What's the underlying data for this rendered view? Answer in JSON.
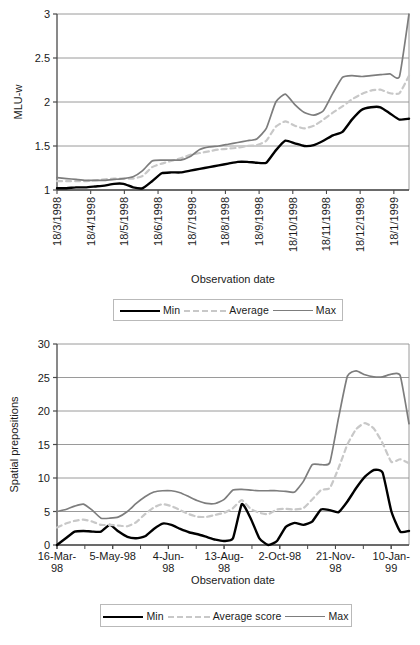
{
  "chart_data": [
    {
      "id": "mlu-chart",
      "type": "line",
      "title": "",
      "xlabel": "Observation date",
      "ylabel": "MLU-w",
      "ylim": [
        1,
        3
      ],
      "yticks": [
        1,
        1.5,
        2,
        2.5,
        3
      ],
      "ytick_labels": [
        "1",
        "1.5",
        "2",
        "2.5",
        "3"
      ],
      "grid": true,
      "legend_position": "below",
      "categories": [
        "18/3/1998",
        "18/4/1998",
        "18/5/1998",
        "18/6/1998",
        "18/7/1998",
        "18/8/1998",
        "18/9/1998",
        "18/10/1998",
        "18/11/1998",
        "18/12/1998",
        "18/1/1999"
      ],
      "x_index": [
        0,
        1,
        2,
        3,
        4,
        5,
        6,
        7,
        8,
        9,
        10,
        11,
        12,
        13,
        14,
        15,
        16,
        17,
        18,
        19,
        20,
        21,
        22,
        23,
        24,
        25,
        26,
        27,
        28,
        29,
        30,
        31,
        32,
        33,
        34,
        35,
        36,
        37
      ],
      "series": [
        {
          "name": "Min",
          "color": "#000000",
          "style": "solid",
          "values": [
            1.02,
            1.02,
            1.03,
            1.03,
            1.04,
            1.05,
            1.07,
            1.07,
            1.03,
            1.02,
            1.1,
            1.19,
            1.2,
            1.2,
            1.22,
            1.24,
            1.26,
            1.28,
            1.3,
            1.32,
            1.32,
            1.31,
            1.31,
            1.45,
            1.56,
            1.53,
            1.5,
            1.51,
            1.56,
            1.62,
            1.66,
            1.8,
            1.91,
            1.94,
            1.94,
            1.87,
            1.8,
            1.81
          ]
        },
        {
          "name": "Average",
          "color": "#c8c8c8",
          "style": "dashed",
          "values": [
            1.1,
            1.1,
            1.1,
            1.1,
            1.11,
            1.12,
            1.13,
            1.13,
            1.13,
            1.16,
            1.26,
            1.3,
            1.33,
            1.36,
            1.4,
            1.42,
            1.44,
            1.46,
            1.47,
            1.48,
            1.5,
            1.51,
            1.56,
            1.72,
            1.78,
            1.73,
            1.7,
            1.73,
            1.8,
            1.88,
            1.95,
            2.03,
            2.09,
            2.13,
            2.14,
            2.1,
            2.1,
            2.3
          ]
        },
        {
          "name": "Max",
          "color": "#7d7d7d",
          "style": "solid",
          "values": [
            1.14,
            1.13,
            1.12,
            1.11,
            1.11,
            1.11,
            1.12,
            1.13,
            1.15,
            1.22,
            1.33,
            1.34,
            1.34,
            1.34,
            1.38,
            1.46,
            1.49,
            1.5,
            1.52,
            1.54,
            1.56,
            1.58,
            1.7,
            2.0,
            2.09,
            1.97,
            1.88,
            1.85,
            1.9,
            2.1,
            2.28,
            2.3,
            2.29,
            2.3,
            2.31,
            2.32,
            2.29,
            3.0
          ]
        }
      ],
      "legend": [
        "Min",
        "Average",
        "Max"
      ]
    },
    {
      "id": "prepositions-chart",
      "type": "line",
      "title": "",
      "xlabel": "Observation date",
      "ylabel": "Spatial prepositions",
      "ylim": [
        0,
        30
      ],
      "yticks": [
        0,
        5,
        10,
        15,
        20,
        25,
        30
      ],
      "ytick_labels": [
        "0",
        "5",
        "10",
        "15",
        "20",
        "25",
        "30"
      ],
      "grid": true,
      "legend_position": "below",
      "categories": [
        "16-Mar-98",
        "5-May-98",
        "4-Jun-98",
        "13-Aug-98",
        "2-Oct-98",
        "21-Nov-98",
        "10-Jan-99"
      ],
      "x_index": [
        0,
        1,
        2,
        3,
        4,
        5,
        6,
        7,
        8,
        9,
        10,
        11,
        12,
        13,
        14,
        15,
        16,
        17,
        18,
        19,
        20,
        21,
        22,
        23,
        24,
        25,
        26,
        27,
        28,
        29,
        30,
        31,
        32,
        33,
        34,
        35,
        36,
        37,
        38,
        39,
        40
      ],
      "series": [
        {
          "name": "Min",
          "color": "#000000",
          "style": "solid",
          "values": [
            0.0,
            1.0,
            2.0,
            2.1,
            2.0,
            2.0,
            3.0,
            2.0,
            1.2,
            1.0,
            1.3,
            2.4,
            3.2,
            3.0,
            2.4,
            1.9,
            1.6,
            1.2,
            0.8,
            0.6,
            1.0,
            6.1,
            4.0,
            1.0,
            0.0,
            0.6,
            2.7,
            3.3,
            3.0,
            3.5,
            5.3,
            5.2,
            4.9,
            6.5,
            8.5,
            10.2,
            11.2,
            10.8,
            5.0,
            2.0,
            2.1
          ]
        },
        {
          "name": "Average score",
          "color": "#c8c8c8",
          "style": "dashed",
          "values": [
            2.6,
            3.2,
            3.6,
            3.8,
            3.5,
            3.0,
            3.0,
            2.9,
            2.8,
            3.4,
            4.6,
            5.6,
            6.1,
            5.8,
            5.2,
            4.6,
            4.2,
            4.2,
            4.5,
            4.8,
            5.5,
            6.7,
            5.4,
            4.8,
            4.6,
            5.3,
            5.4,
            5.3,
            5.5,
            6.8,
            8.2,
            8.5,
            11.5,
            15.0,
            17.3,
            18.2,
            17.4,
            15.2,
            12.4,
            12.8,
            12.2
          ]
        },
        {
          "name": "Max",
          "color": "#7d7d7d",
          "style": "solid",
          "values": [
            5.0,
            5.3,
            5.8,
            6.1,
            5.2,
            4.0,
            4.0,
            4.2,
            5.0,
            6.2,
            7.2,
            7.9,
            8.1,
            8.1,
            7.8,
            7.2,
            6.6,
            6.2,
            6.2,
            6.8,
            8.2,
            8.3,
            8.2,
            8.1,
            8.1,
            8.1,
            8.0,
            7.9,
            9.5,
            12.0,
            12.0,
            12.3,
            19.0,
            25.2,
            26.0,
            25.4,
            25.1,
            25.1,
            25.5,
            25.3,
            18.1
          ]
        }
      ],
      "legend": [
        "Min",
        "Average score",
        "Max"
      ]
    }
  ],
  "charts": {
    "top": {
      "ylabel": "MLU-w",
      "xlabel": "Observation date",
      "ytick_labels": [
        "3",
        "2.5",
        "2",
        "1.5",
        "1"
      ],
      "xtick_labels": [
        "18/3/1998",
        "18/4/1998",
        "18/5/1998",
        "18/6/1998",
        "18/7/1998",
        "18/8/1998",
        "18/9/1998",
        "18/10/1998",
        "18/11/1998",
        "18/12/1998",
        "18/1/1999"
      ],
      "legend": [
        {
          "label": "Min",
          "style": "min"
        },
        {
          "label": "Average",
          "style": "avg"
        },
        {
          "label": "Max",
          "style": "max"
        }
      ]
    },
    "bottom": {
      "ylabel": "Spatial prepositions",
      "xlabel": "Observation date",
      "ytick_labels": [
        "30",
        "25",
        "20",
        "15",
        "10",
        "5",
        "0"
      ],
      "xtick_labels": [
        "16-Mar-\n98",
        "5-May-98",
        "4-Jun-\n98",
        "13-Aug-\n98",
        "2-Oct-98",
        "21-Nov-\n98",
        "10-Jan-\n99"
      ],
      "legend": [
        {
          "label": "Min",
          "style": "min"
        },
        {
          "label": "Average score",
          "style": "avg"
        },
        {
          "label": "Max",
          "style": "max"
        }
      ]
    }
  }
}
